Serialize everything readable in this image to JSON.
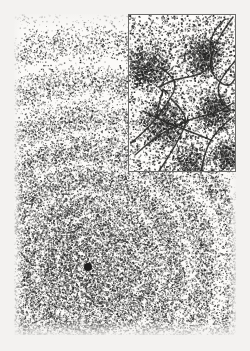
{
  "figure": {
    "domain_label": "scientific-micrograph-figure",
    "canvas": {
      "width": 250,
      "height": 351,
      "background": "#f2f1ef"
    },
    "colors": {
      "paper": "#f3f2f0",
      "plate": "#fbfaf8",
      "stipple_dark": "#1d1d1d",
      "stipple_mid": "#3a3a38",
      "stipple_light": "#6e6e6c",
      "inset_border": "#6a6a68",
      "inset_plate": "#fcfbf9",
      "boundary_line": "#2a2a28"
    }
  },
  "main_panel": {
    "name": "concentric-ring-micrograph",
    "bounds": {
      "x": 14,
      "y": 14,
      "width": 222,
      "height": 321
    },
    "ring_center": {
      "x": 74,
      "y": 253
    },
    "ring_count": 9,
    "ring_radii": [
      7,
      22,
      40,
      62,
      88,
      117,
      150,
      186,
      225,
      268
    ],
    "ring_band_width": 9,
    "core_dot_radius": 4,
    "stipple_density": 0.46,
    "stipple_dot_size": [
      0.55,
      1.5
    ],
    "ring_eccentricity": 1.0
  },
  "inset_panel": {
    "name": "domain-boundary-inset",
    "bounds": {
      "x": 128,
      "y": 14,
      "width": 108,
      "height": 158
    },
    "border_width": 1,
    "stipple_density": 0.2,
    "stipple_dot_size": [
      0.6,
      1.8
    ],
    "dense_clusters": [
      {
        "cx": 18,
        "cy": 52,
        "r": 26
      },
      {
        "cx": 74,
        "cy": 40,
        "r": 24
      },
      {
        "cx": 34,
        "cy": 108,
        "r": 26
      },
      {
        "cx": 86,
        "cy": 96,
        "r": 22
      },
      {
        "cx": 60,
        "cy": 148,
        "r": 20
      },
      {
        "cx": 98,
        "cy": 140,
        "r": 18
      }
    ],
    "boundary_lines": [
      {
        "id": "line-zigzag-upper-right",
        "points": [
          [
            104,
            2
          ],
          [
            94,
            16
          ],
          [
            84,
            34
          ],
          [
            80,
            52
          ],
          [
            88,
            66
          ],
          [
            100,
            72
          ],
          [
            106,
            64
          ]
        ]
      },
      {
        "id": "line-s-curve-main",
        "points": [
          [
            30,
            72
          ],
          [
            46,
            64
          ],
          [
            62,
            62
          ],
          [
            78,
            56
          ],
          [
            84,
            44
          ],
          [
            80,
            30
          ],
          [
            86,
            14
          ],
          [
            96,
            4
          ]
        ]
      },
      {
        "id": "line-diagonal-left",
        "points": [
          [
            2,
            128
          ],
          [
            16,
            116
          ],
          [
            30,
            100
          ],
          [
            40,
            86
          ],
          [
            48,
            70
          ],
          [
            40,
            58
          ],
          [
            30,
            52
          ]
        ]
      },
      {
        "id": "line-long-descender",
        "points": [
          [
            6,
            140
          ],
          [
            24,
            124
          ],
          [
            44,
            112
          ],
          [
            62,
            104
          ],
          [
            78,
            100
          ],
          [
            92,
            96
          ],
          [
            104,
            88
          ]
        ]
      },
      {
        "id": "line-lower-zigzag",
        "points": [
          [
            30,
            156
          ],
          [
            42,
            138
          ],
          [
            52,
            120
          ],
          [
            58,
            106
          ],
          [
            52,
            94
          ],
          [
            42,
            84
          ]
        ]
      },
      {
        "id": "line-lower-cross",
        "points": [
          [
            14,
            96
          ],
          [
            34,
            106
          ],
          [
            54,
            114
          ],
          [
            70,
            120
          ],
          [
            84,
            126
          ]
        ]
      },
      {
        "id": "line-right-branch",
        "points": [
          [
            106,
            46
          ],
          [
            96,
            58
          ],
          [
            88,
            72
          ],
          [
            92,
            86
          ],
          [
            100,
            94
          ]
        ]
      },
      {
        "id": "line-right-tail",
        "points": [
          [
            104,
            102
          ],
          [
            92,
            112
          ],
          [
            82,
            124
          ],
          [
            76,
            138
          ],
          [
            72,
            156
          ]
        ]
      },
      {
        "id": "line-arrow-stub",
        "points": [
          [
            34,
            76
          ],
          [
            30,
            88
          ],
          [
            28,
            100
          ]
        ]
      }
    ],
    "arrow_markers": [
      {
        "id": "arrow-upper-left",
        "x": 34,
        "y": 74,
        "angle": 250
      },
      {
        "id": "arrow-mid",
        "x": 58,
        "y": 108,
        "angle": 70
      }
    ]
  }
}
